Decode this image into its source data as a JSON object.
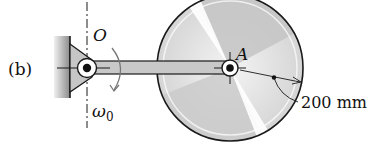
{
  "figure": {
    "part_label": "(b)",
    "pivot_label": "O",
    "disk_center_label": "A",
    "angular_velocity_symbol": "ω",
    "angular_velocity_subscript": "0",
    "dimension_label": "200 mm"
  },
  "colors": {
    "stroke": "#1a1a1a",
    "bar_fill": "#c8c8c8",
    "disk_light": "#f2f2f2",
    "disk_dark": "#bdbdbd",
    "wall_fill": "#9a9a9a"
  }
}
